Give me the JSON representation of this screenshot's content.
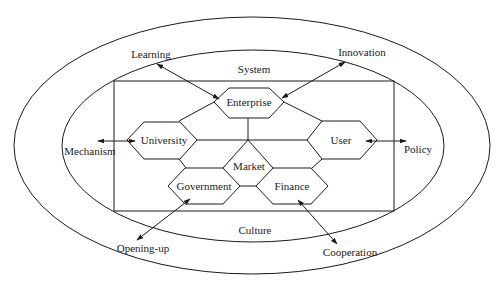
{
  "diagram": {
    "outer_ring": {
      "labels": {
        "top_left": "Learning",
        "top_right": "Innovation",
        "left": "Mechanism",
        "right": "Policy",
        "bottom_left": "Opening-up",
        "bottom_right": "Cooperation"
      }
    },
    "inner_ring": {
      "top_label": "System",
      "bottom_label": "Culture"
    },
    "nodes": {
      "enterprise": "Enterprise",
      "university": "University",
      "user": "User",
      "market": "Market",
      "government": "Government",
      "finance": "Finance"
    },
    "colors": {
      "line": "#1a1a1a",
      "background": "#ffffff"
    }
  }
}
